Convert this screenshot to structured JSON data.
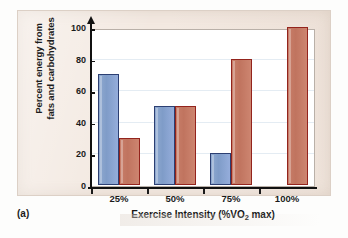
{
  "figure": {
    "caption": "(a)",
    "panel_background": "#f3e9e1"
  },
  "chart_data": {
    "type": "bar",
    "title": "",
    "categories": [
      "25%",
      "50%",
      "75%",
      "100%"
    ],
    "series": [
      {
        "name": "Fats",
        "color": "#7f9cc8",
        "border_color": "#2c3f72",
        "values": [
          70,
          50,
          20,
          0
        ]
      },
      {
        "name": "Carbohydrates",
        "color": "#c0745f",
        "border_color": "#93241d",
        "values": [
          30,
          50,
          80,
          100
        ]
      }
    ],
    "xlabel": "Exercise Intensity (%VO2 max)",
    "xlabel_parts": {
      "pre": "Exercise Intensity (%VO",
      "sub": "2",
      "post": " max)"
    },
    "ylabel": "Percent energy from fats and carbohydrates",
    "ylabel_line1": "Percent energy from",
    "ylabel_line2": "fats and carbohydrates",
    "ylim": [
      0,
      100
    ],
    "yticks": [
      0,
      20,
      40,
      60,
      80,
      100
    ],
    "ytick_labels": [
      "0",
      "20",
      "40",
      "60",
      "80",
      "100"
    ],
    "grid": true,
    "grid_color": "#e4ecf3",
    "legend": "none",
    "axis_arrow_y": true
  }
}
